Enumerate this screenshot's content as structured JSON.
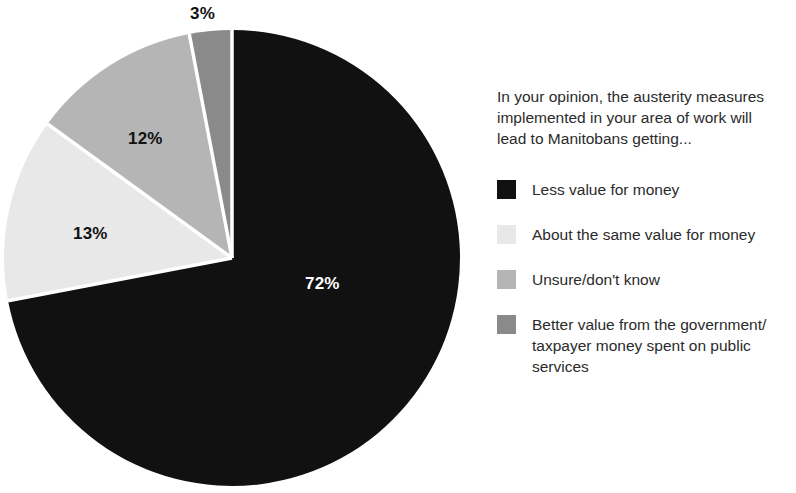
{
  "chart_data": {
    "type": "pie",
    "title": "In your opinion, the austerity measures implemented in your area of work will lead to Manitobans getting...",
    "xlabel": "",
    "ylabel": "",
    "categories": [
      "Less value for money",
      "About the same value for money",
      "Unsure/don't know",
      "Better value from the government/ taxpayer money spent on public services"
    ],
    "values": [
      72,
      13,
      12,
      3
    ],
    "value_labels": [
      "72%",
      "13%",
      "12%",
      "3%"
    ],
    "colors": [
      "#111111",
      "#e8e8e8",
      "#b5b5b5",
      "#8a8a8a"
    ],
    "legend_position": "right",
    "grid": false
  },
  "legend": {
    "title_line_1": "In your opinion, the austerity measures",
    "title_line_2": "implemented in your area of work will",
    "title_line_3": "lead to Manitobans getting...",
    "items": [
      {
        "label": "Less value for money",
        "color": "#111111"
      },
      {
        "label": "About the same value for money",
        "color": "#e8e8e8"
      },
      {
        "label": "Unsure/don't know",
        "color": "#b5b5b5"
      },
      {
        "label": "Better value from the government/\ntaxpayer money spent on public\nservices",
        "color": "#8a8a8a"
      }
    ]
  },
  "pie": {
    "labels": [
      {
        "text": "72%",
        "left": 305,
        "top": 274,
        "dark_background": true
      },
      {
        "text": "13%",
        "left": 73,
        "top": 224,
        "dark_background": false
      },
      {
        "text": "12%",
        "left": 128,
        "top": 129,
        "dark_background": false
      },
      {
        "text": "3%",
        "left": 190,
        "top": 4,
        "dark_background": false
      }
    ]
  }
}
